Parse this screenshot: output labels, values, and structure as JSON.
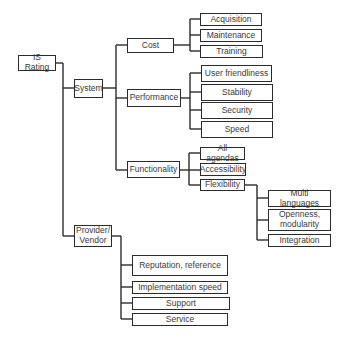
{
  "diagram": {
    "type": "hierarchy-tree",
    "root": "IS Rating",
    "nodes": {
      "is_rating": "IS Rating",
      "system": "System",
      "provider": "Provider/\nVendor",
      "cost": "Cost",
      "performance": "Performance",
      "functionality": "Functionality",
      "acquisition": "Acquisition",
      "maintenance": "Maintenance",
      "training": "Training",
      "user_friendliness": "User friendliness",
      "stability": "Stability",
      "security": "Security",
      "speed": "Speed",
      "all_agendas": "All agendas",
      "accessibility": "Accessibility",
      "flexibility": "Flexibility",
      "multi_languages": "Multi languages",
      "openness": "Openness,\nmodularity",
      "integration": "Integration",
      "reputation": "Reputation, reference",
      "implementation_speed": "Implementation speed",
      "support": "Support",
      "service": "Service"
    },
    "tree": {
      "IS Rating": {
        "System": {
          "Cost": [
            "Acquisition",
            "Maintenance",
            "Training"
          ],
          "Performance": [
            "User friendliness",
            "Stability",
            "Security",
            "Speed"
          ],
          "Functionality": {
            "All agendas": [],
            "Accessibility": [],
            "Flexibility": [
              "Multi languages",
              "Openness, modularity",
              "Integration"
            ]
          }
        },
        "Provider/Vendor": [
          "Reputation, reference",
          "Implementation speed",
          "Support",
          "Service"
        ]
      }
    }
  }
}
